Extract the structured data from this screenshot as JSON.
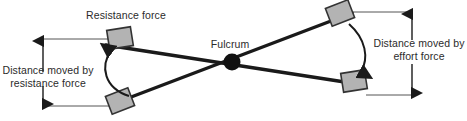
{
  "figure": {
    "type": "lever-mechanics-diagram",
    "width": 467,
    "height": 121,
    "background_color": "#ffffff"
  },
  "labels": {
    "resistance_force": "Resistance force",
    "fulcrum": "Fulcrum",
    "distance_moved_by_resistance_force": "Distance moved by\nresistance force",
    "distance_moved_by_effort_force": "Distance moved by\neffort force"
  },
  "colors": {
    "stroke": "#1a1a1a",
    "text": "#2b2b2b",
    "block_fill": "#b3b3b3",
    "block_stroke": "#333333",
    "guide_line": "#555555"
  },
  "elements": {
    "fulcrum_point": {
      "x": 232,
      "y": 62,
      "radius": 8
    },
    "lever_bars": [
      {
        "name": "bar-raised",
        "x1": 108,
        "y1": 44,
        "x2": 362,
        "y2": 84
      },
      {
        "name": "bar-lowered",
        "x1": 120,
        "y1": 100,
        "x2": 350,
        "y2": 14
      }
    ],
    "blocks": [
      {
        "name": "block-resistance-raised",
        "cx": 120,
        "cy": 38,
        "w": 24,
        "h": 19,
        "rotation": -10
      },
      {
        "name": "block-resistance-lowered",
        "cx": 120,
        "cy": 101,
        "w": 24,
        "h": 19,
        "rotation": -20
      },
      {
        "name": "block-effort-raised",
        "cx": 340,
        "cy": 14,
        "w": 24,
        "h": 19,
        "rotation": -20
      },
      {
        "name": "block-effort-lowered",
        "cx": 354,
        "cy": 81,
        "w": 24,
        "h": 19,
        "rotation": -10
      }
    ],
    "measure_arrows": [
      {
        "name": "arrow-distance-resistance",
        "x": 43,
        "y_top": 39,
        "y_bottom": 106,
        "double_headed": true
      },
      {
        "name": "arrow-distance-effort",
        "x": 412,
        "y_top": 12,
        "y_bottom": 95,
        "double_headed": true
      }
    ],
    "rotation_arcs": [
      {
        "name": "arc-resistance-rotation",
        "direction": "counterclockwise",
        "from": "lower-left-block",
        "to": "upper-left-block"
      },
      {
        "name": "arc-effort-rotation",
        "direction": "clockwise",
        "from": "upper-right-block",
        "to": "lower-right-block"
      }
    ]
  }
}
